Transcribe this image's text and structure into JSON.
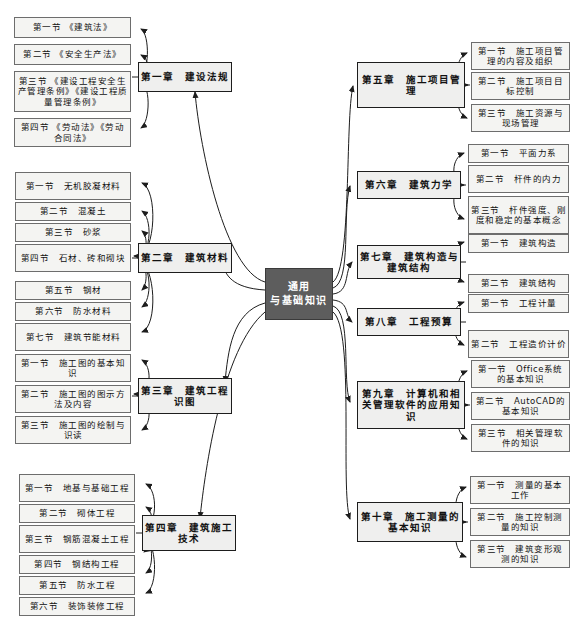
{
  "diagram": {
    "root": {
      "label": "通用\n与基础知识",
      "line1": "通用",
      "line2": "与基础知识",
      "color": "#5d5d5d",
      "text_color": "#ffffff"
    },
    "colors": {
      "leaf_fill": "#f4f4f2",
      "leaf_border": "#6d6d6d",
      "chapter_fill": "#efefee",
      "chapter_border": "#1d1d1d",
      "link": "#1d1d1d",
      "page_background": "#ffffff"
    },
    "left_branches": [
      {
        "chapter": "第一章　建设法规",
        "leaves": [
          "第一节 《建筑法》",
          "第二节 《安全生产法》",
          "第三节 《建设工程安全生产管理条例》《建设工程质量管理条例》",
          "第四节 《劳动法》《劳动合同法》"
        ]
      },
      {
        "chapter": "第二章　建筑材料",
        "leaves": [
          "第一节　无机胶凝材料",
          "第二节　混凝土",
          "第三节　砂浆",
          "第四节　石材、砖和砌块",
          "第五节　钢材",
          "第六节　防水材料",
          "第七节　建筑节能材料"
        ]
      },
      {
        "chapter": "第三章　建筑工程识图",
        "leaves": [
          "第一节　施工图的基本知识",
          "第二节　施工图的图示方法及内容",
          "第三节　施工图的绘制与识读"
        ]
      },
      {
        "chapter": "第四章　建筑施工技术",
        "leaves": [
          "第一节　地基与基础工程",
          "第二节　砌体工程",
          "第三节　钢筋混凝土工程",
          "第四节　钢结构工程",
          "第五节　防水工程",
          "第六节　装饰装修工程"
        ]
      }
    ],
    "right_branches": [
      {
        "chapter": "第五章　施工项目管理",
        "leaves": [
          "第一节　施工项目管理的内容及组织",
          "第二节　施工项目目标控制",
          "第三节　施工资源与现场管理"
        ]
      },
      {
        "chapter": "第六章　建筑力学",
        "leaves": [
          "第一节　平面力系",
          "第二节　杆件的内力",
          "第三节　杆件强度、刚度和稳定的基本概念"
        ]
      },
      {
        "chapter": "第七章　建筑构造与建筑结构",
        "leaves": [
          "第一节　建筑构造",
          "第二节　建筑结构"
        ]
      },
      {
        "chapter": "第八章　工程预算",
        "leaves": [
          "第一节　工程计量",
          "第二节　工程造价计价"
        ]
      },
      {
        "chapter": "第九章　计算机和相关管理软件的应用知识",
        "leaves": [
          "第一节　Office系统的基本知识",
          "第二节　AutoCAD的基本知识",
          "第三节　相关管理软件的知识"
        ]
      },
      {
        "chapter": "第十章　施工测量的基本知识",
        "leaves": [
          "第一节　测量的基本工作",
          "第二节　施工控制测量的知识",
          "第三节　建筑变形观测的知识"
        ]
      }
    ]
  }
}
